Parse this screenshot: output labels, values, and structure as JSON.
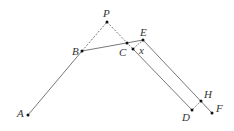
{
  "diagram": {
    "points": {
      "A": {
        "label": "A",
        "x": 28,
        "y": 115,
        "lx": 17,
        "ly": 117
      },
      "B": {
        "label": "B",
        "x": 82,
        "y": 51,
        "lx": 72,
        "ly": 55
      },
      "P": {
        "label": "P",
        "x": 107,
        "y": 22,
        "lx": 103,
        "ly": 17
      },
      "C": {
        "label": "C",
        "x": 127,
        "y": 43,
        "lx": 119,
        "ly": 56
      },
      "C2": {
        "label": "",
        "x": 133,
        "y": 49
      },
      "E": {
        "label": "E",
        "x": 143,
        "y": 40,
        "lx": 140,
        "ly": 36
      },
      "D": {
        "label": "D",
        "x": 192,
        "y": 110,
        "lx": 182,
        "ly": 121
      },
      "H": {
        "label": "H",
        "x": 201,
        "y": 101,
        "lx": 204,
        "ly": 98
      },
      "F": {
        "label": "F",
        "x": 212,
        "y": 113,
        "lx": 216,
        "ly": 112
      }
    },
    "angle_label": {
      "text": "x",
      "x": 139,
      "y": 54
    },
    "line_color": "#555555",
    "dot_color": "#111111"
  }
}
